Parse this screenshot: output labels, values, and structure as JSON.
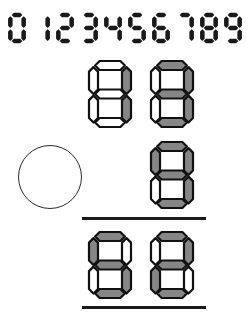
{
  "worksheet": {
    "title": "Seven-segment arithmetic worksheet",
    "ink_color": "#1a1a1a",
    "segment_on_color": "#868686",
    "segment_off_color": "#ffffff"
  },
  "digit_strip": {
    "name": "digit-reference-strip",
    "text": "0123456789",
    "digits": [
      {
        "label": "0",
        "segments": "1110111"
      },
      {
        "label": "1",
        "segments": "0010010"
      },
      {
        "label": "2",
        "segments": "1011101"
      },
      {
        "label": "3",
        "segments": "1011011"
      },
      {
        "label": "4",
        "segments": "0111010"
      },
      {
        "label": "5",
        "segments": "1101011"
      },
      {
        "label": "6",
        "segments": "1101111"
      },
      {
        "label": "7",
        "segments": "1010010"
      },
      {
        "label": "8",
        "segments": "1111111"
      },
      {
        "label": "9",
        "segments": "1111011"
      }
    ]
  },
  "problem": {
    "operand_row_1": {
      "name": "operand-row-upper",
      "value": "13",
      "cells": [
        {
          "name": "operand-digit-tens",
          "label": "1",
          "segments": "0010010"
        },
        {
          "name": "operand-digit-ones",
          "label": "3",
          "segments": "1011011"
        }
      ]
    },
    "operand_row_2": {
      "name": "operand-row-lower",
      "value": "9",
      "cells": [
        {
          "name": "operand-digit-ones",
          "label": "9",
          "segments": "1111011"
        }
      ]
    },
    "operator": {
      "name": "operator-circle",
      "label": "",
      "shape": "circle",
      "state": "blank"
    },
    "result_row": {
      "name": "result-row",
      "value": "52",
      "cells": [
        {
          "name": "result-digit-tens",
          "label": "5",
          "segments": "1101011"
        },
        {
          "name": "result-digit-ones",
          "label": "2",
          "segments": "1011101"
        }
      ]
    },
    "rules": [
      {
        "name": "fraction-rule-top"
      },
      {
        "name": "fraction-rule-bottom"
      }
    ]
  }
}
